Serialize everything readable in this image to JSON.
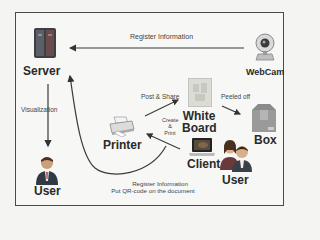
{
  "diagram": {
    "nodes": {
      "server": {
        "label": "Server"
      },
      "webcam": {
        "label": "WebCam"
      },
      "user_left": {
        "label": "User"
      },
      "printer": {
        "label": "Printer"
      },
      "whiteboard": {
        "label_line1": "White",
        "label_line2": "Board"
      },
      "box": {
        "label": "Box"
      },
      "client": {
        "label": "Client"
      },
      "user_right": {
        "label": "User"
      }
    },
    "edges": {
      "webcam_to_server": {
        "label": "Register Information"
      },
      "server_to_user": {
        "label": "Visualization"
      },
      "printer_to_whiteboard": {
        "label": "Post & Share"
      },
      "whiteboard_to_box": {
        "label": "Peeled off"
      },
      "client_to_printer": {
        "label_line1": "Create",
        "label_line2": "&",
        "label_line3": "Print"
      },
      "client_to_server": {
        "label_line1": "Register Information",
        "label_line2": "Put QR-code on the document"
      }
    },
    "colors": {
      "frame": "#4a4a4a",
      "arrow": "#3a3a3a",
      "background": "#f7f7f5"
    }
  }
}
